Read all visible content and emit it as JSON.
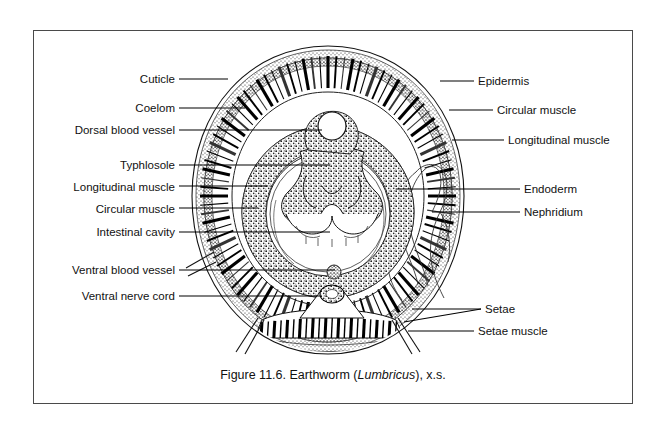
{
  "figure": {
    "caption_prefix": "Figure 11.6. Earthworm (",
    "caption_italic": "Lumbricus",
    "caption_suffix": "), x.s.",
    "border_color": "#4a4a4a",
    "background": "#ffffff",
    "ink_color": "#000000"
  },
  "labels_left": [
    {
      "id": "cuticle",
      "text": "Cuticle",
      "x": 175,
      "y": 73,
      "line_x2": 228,
      "line_y2": 79
    },
    {
      "id": "coelom",
      "text": "Coelom",
      "x": 175,
      "y": 102,
      "line_x2": 245,
      "line_y2": 108
    },
    {
      "id": "dorsal-blood-vessel",
      "text": "Dorsal blood vessel",
      "x": 175,
      "y": 124,
      "line_x2": 322,
      "line_y2": 130
    },
    {
      "id": "typhlosole",
      "text": "Typhlosole",
      "x": 175,
      "y": 159,
      "line_x2": 330,
      "line_y2": 165
    },
    {
      "id": "longitudinal-muscle-left",
      "text": "Longitudinal muscle",
      "x": 175,
      "y": 181,
      "line_x2": 268,
      "line_y2": 186
    },
    {
      "id": "circular-muscle-left",
      "text": "Circular muscle",
      "x": 175,
      "y": 203,
      "line_x2": 258,
      "line_y2": 208
    },
    {
      "id": "intestinal-cavity",
      "text": "Intestinal cavity",
      "x": 175,
      "y": 226,
      "line_x2": 330,
      "line_y2": 232
    },
    {
      "id": "ventral-blood-vessel",
      "text": "Ventral blood vessel",
      "x": 175,
      "y": 264,
      "line_x2": 335,
      "line_y2": 270
    },
    {
      "id": "ventral-nerve-cord",
      "text": "Ventral nerve cord",
      "x": 175,
      "y": 290,
      "line_x2": 320,
      "line_y2": 296
    }
  ],
  "labels_right": [
    {
      "id": "epidermis",
      "text": "Epidermis",
      "x": 478,
      "y": 75,
      "line_x1": 440,
      "line_y1": 81,
      "line_x2": 474
    },
    {
      "id": "circular-muscle-right",
      "text": "Circular muscle",
      "x": 497,
      "y": 104,
      "line_x1": 449,
      "line_y1": 110,
      "line_x2": 493
    },
    {
      "id": "longitudinal-muscle-right",
      "text": "Longitudinal muscle",
      "x": 508,
      "y": 134,
      "line_x1": 452,
      "line_y1": 140,
      "line_x2": 504
    },
    {
      "id": "endoderm",
      "text": "Endoderm",
      "x": 524,
      "y": 183,
      "line_x1": 396,
      "line_y1": 189,
      "line_x2": 520
    },
    {
      "id": "nephridium",
      "text": "Nephridium",
      "x": 524,
      "y": 206,
      "line_x1": 432,
      "line_y1": 212,
      "line_x2": 520
    },
    {
      "id": "setae",
      "text": "Setae",
      "x": 485,
      "y": 303,
      "line_x1": 412,
      "line_y1": 309,
      "line_x2": 481
    },
    {
      "id": "setae-muscle",
      "text": "Setae muscle",
      "x": 478,
      "y": 325,
      "line_x1": 408,
      "line_y1": 331,
      "line_x2": 474
    }
  ],
  "anatomy": {
    "body_outline": "earthworm cross section",
    "dorsal_vessel_circle": {
      "cx": 332,
      "cy": 126,
      "r": 14
    },
    "nerve_cord": {
      "cx": 331,
      "cy": 296,
      "rx": 11,
      "ry": 8
    },
    "muscle_band_count": 96,
    "setae_count": 4
  }
}
